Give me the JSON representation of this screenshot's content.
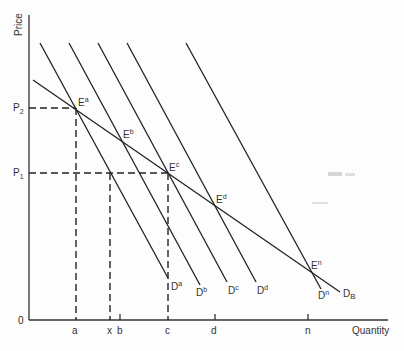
{
  "diagram": {
    "axes": {
      "y_label": "Price",
      "x_label": "Quantity",
      "origin_label": "0",
      "y_ticks": [
        {
          "id": "P2",
          "base": "P",
          "sub": "2"
        },
        {
          "id": "P1",
          "base": "P",
          "sub": "1"
        }
      ],
      "x_ticks": [
        "a",
        "x",
        "b",
        "c",
        "d",
        "n"
      ]
    },
    "demand_curves": [
      {
        "id": "Da",
        "base": "D",
        "sup": "a"
      },
      {
        "id": "Db",
        "base": "D",
        "sup": "b"
      },
      {
        "id": "Dc",
        "base": "D",
        "sup": "c"
      },
      {
        "id": "Dd",
        "base": "D",
        "sup": "d"
      },
      {
        "id": "Dn",
        "base": "D",
        "sup": "n"
      },
      {
        "id": "DB",
        "base": "D",
        "sub": "B"
      }
    ],
    "equilibria": [
      {
        "id": "Ea",
        "base": "E",
        "sup": "a"
      },
      {
        "id": "Eb",
        "base": "E",
        "sup": "b"
      },
      {
        "id": "Ec",
        "base": "E",
        "sup": "c"
      },
      {
        "id": "Ed",
        "base": "E",
        "sup": "d"
      },
      {
        "id": "En",
        "base": "E",
        "sup": "n"
      }
    ]
  }
}
